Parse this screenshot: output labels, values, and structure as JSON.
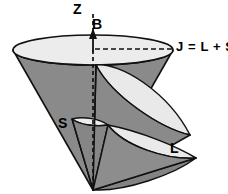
{
  "figure": {
    "type": "diagram",
    "background_color": "#ffffff"
  },
  "colors": {
    "background": "#ffffff",
    "cone_body": "#8a8a8a",
    "cone_body_dark": "#7b7b7b",
    "cone_top_light": "#e6e6e6",
    "cone_top_lighter": "#efefef",
    "outline": "#111111",
    "dash": "#111111",
    "text": "#000000"
  },
  "labels": {
    "z_axis": "Z",
    "b_field": "B",
    "total_angular_momentum": "J = L + S",
    "spin": "S",
    "orbital": "L"
  },
  "geometry": {
    "axis_x": 93,
    "big_cone_apex": [
      93,
      190
    ],
    "big_cone_rim_center": [
      93,
      50
    ],
    "big_cone_rim_rx": 80,
    "big_cone_rim_ry": 15,
    "j_dash_line": [
      93,
      50,
      174,
      50
    ],
    "z_dash_line_top": [
      93,
      14
    ],
    "b_arrow_tip": [
      93,
      36
    ]
  },
  "elements": [
    {
      "name": "big-cone-j",
      "label": "J = L + S",
      "description": "large precession cone about Z axis"
    },
    {
      "name": "cone-l",
      "label": "L",
      "description": "orbital angular momentum precession cone"
    },
    {
      "name": "cone-s",
      "label": "S",
      "description": "spin angular momentum precession cone"
    },
    {
      "name": "z-axis",
      "label": "Z",
      "description": "vertical dashed quantization axis"
    },
    {
      "name": "b-arrow",
      "label": "B",
      "description": "magnetic field direction arrow"
    }
  ]
}
